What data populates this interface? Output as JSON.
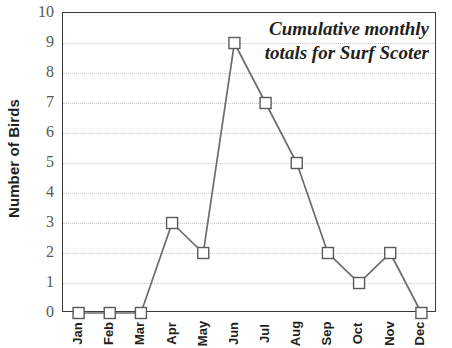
{
  "chart_data": {
    "type": "line",
    "title_lines": [
      "Cumulative monthly",
      "totals for Surf Scoter"
    ],
    "xlabel": "",
    "ylabel": "Number of Birds",
    "categories": [
      "Jan",
      "Feb",
      "Mar",
      "Apr",
      "May",
      "Jun",
      "Jul",
      "Aug",
      "Sep",
      "Oct",
      "Nov",
      "Dec"
    ],
    "values": [
      0,
      0,
      0,
      3,
      2,
      9,
      7,
      5,
      2,
      1,
      2,
      0
    ],
    "series": [
      {
        "name": "Surf Scoter",
        "values": [
          0,
          0,
          0,
          3,
          2,
          9,
          7,
          5,
          2,
          1,
          2,
          0
        ]
      }
    ],
    "ylim": [
      0,
      10
    ],
    "y_ticks": [
      10,
      9,
      8,
      7,
      6,
      5,
      4,
      3,
      2,
      1,
      0
    ],
    "grid": true,
    "grid_axis": "y",
    "legend": "none",
    "marker": "open-square",
    "colors": {
      "line": "#6b6b6b",
      "marker_fill": "#ffffff",
      "marker_edge": "#5a5a5a",
      "grid": "#c9c9cc",
      "frame": "#3b3b3b",
      "text": "#231f20",
      "tick_text": "#58595b"
    }
  }
}
